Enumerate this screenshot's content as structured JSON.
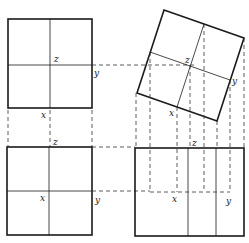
{
  "diagram": {
    "type": "orthographic-projection-of-rotated-square",
    "views": [
      {
        "name": "top-left-view",
        "labels": {
          "z": "z",
          "y": "y",
          "x": "x"
        }
      },
      {
        "name": "rotated-view",
        "labels": {
          "z": "z",
          "y": "y",
          "x": "x"
        }
      },
      {
        "name": "bottom-left-view",
        "labels": {
          "z": "z",
          "x": "x",
          "y": "y"
        }
      },
      {
        "name": "bottom-right-view",
        "labels": {
          "z": "z",
          "x": "x",
          "y": "y"
        }
      }
    ]
  }
}
